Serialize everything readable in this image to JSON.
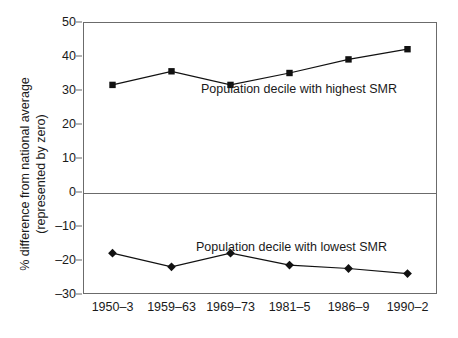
{
  "chart_data": {
    "type": "line",
    "title": "",
    "xlabel": "",
    "ylabel": "% difference from national average (represented by zero)",
    "ylabel_line1": "% difference from national average",
    "ylabel_line2": "(represented by zero)",
    "categories": [
      "1950–3",
      "1959–63",
      "1969–73",
      "1981–5",
      "1986–9",
      "1990–2"
    ],
    "ylim": [
      -30,
      50
    ],
    "yticks": [
      50,
      40,
      30,
      20,
      10,
      0,
      -10,
      -20,
      -30
    ],
    "ytick_labels": [
      "50",
      "40",
      "30",
      "20",
      "10",
      "0",
      "–10",
      "–20",
      "–30"
    ],
    "grid": false,
    "legend_position": "inline-annotation",
    "reference_line": 0,
    "series": [
      {
        "name": "Population decile with highest SMR",
        "marker": "square",
        "color": "#111111",
        "values": [
          31.5,
          35.5,
          31.5,
          35.0,
          39.0,
          42.0
        ]
      },
      {
        "name": "Population decile with lowest SMR",
        "marker": "diamond",
        "color": "#111111",
        "values": [
          -18.0,
          -22.0,
          -18.0,
          -21.5,
          -22.5,
          -24.0
        ]
      }
    ],
    "annotations": [
      {
        "text": "Population decile with highest SMR",
        "series": 0
      },
      {
        "text": "Population decile with lowest SMR",
        "series": 1
      }
    ],
    "colors": {
      "axis": "#6b6b6b",
      "text": "#1a1a1a",
      "marker": "#111111",
      "line": "#111111",
      "background": "#ffffff"
    }
  }
}
